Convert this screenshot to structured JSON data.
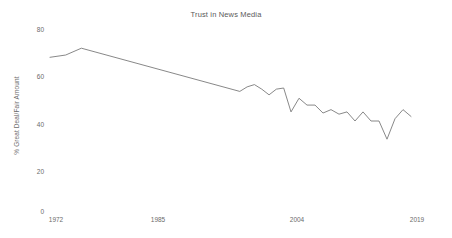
{
  "chart_data": {
    "type": "line",
    "title": "Trust in News Media",
    "xlabel": "",
    "ylabel": "% Great Deal/Fair Amount",
    "xlim": [
      1972,
      2019
    ],
    "ylim": [
      0,
      80
    ],
    "grid": false,
    "legend": false,
    "line_color": "#7a7a7a",
    "x_ticks": [
      "1972",
      "1985",
      "2004",
      "2019"
    ],
    "y_ticks": [
      "0",
      "20",
      "40",
      "60",
      "80"
    ],
    "x": [
      1972,
      1974,
      1976,
      1997,
      1998,
      1999,
      2000,
      2001,
      2002,
      2003,
      2004,
      2005,
      2006,
      2007,
      2008,
      2009,
      2010,
      2011,
      2012,
      2013,
      2014,
      2015,
      2016,
      2017,
      2018,
      2019
    ],
    "values": [
      68,
      69,
      72,
      53,
      55,
      56,
      54,
      51.5,
      54,
      54.5,
      44,
      50,
      47,
      47,
      43.5,
      45,
      43,
      44,
      40,
      44,
      40,
      40,
      32,
      41,
      45,
      42
    ],
    "series": [
      {
        "name": "Trust in News Media",
        "values": [
          68,
          69,
          72,
          53,
          55,
          56,
          54,
          51.5,
          54,
          54.5,
          44,
          50,
          47,
          47,
          43.5,
          45,
          43,
          44,
          40,
          44,
          40,
          40,
          32,
          41,
          45,
          42
        ]
      }
    ]
  },
  "axis": {
    "y_ticks": [
      {
        "label": "80",
        "value": 80
      },
      {
        "label": "60",
        "value": 60
      },
      {
        "label": "40",
        "value": 40
      },
      {
        "label": "20",
        "value": 20
      },
      {
        "label": "0",
        "value": 0
      }
    ],
    "x_ticks": [
      {
        "label": "1972",
        "value": 1972
      },
      {
        "label": "1985",
        "value": 1985
      },
      {
        "label": "2004",
        "value": 2004
      },
      {
        "label": "2019",
        "value": 2019
      }
    ]
  }
}
